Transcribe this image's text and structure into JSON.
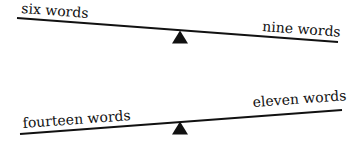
{
  "diagram": {
    "type": "balance-scales",
    "colors": {
      "ink": "#111111",
      "background": "#ffffff"
    },
    "scales": [
      {
        "id": "top",
        "left_label": "six words",
        "right_label": "nine words",
        "tilt": "right-side-down"
      },
      {
        "id": "bottom",
        "left_label": "fourteen words",
        "right_label": "eleven words",
        "tilt": "left-side-down"
      }
    ]
  }
}
